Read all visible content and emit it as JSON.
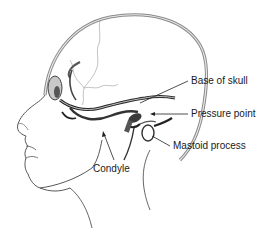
{
  "diagram": {
    "labels": [
      {
        "id": "base-of-skull",
        "text": "Base of skull"
      },
      {
        "id": "pressure-point",
        "text": "Pressure point"
      },
      {
        "id": "mastoid-process",
        "text": "Mastoid process"
      },
      {
        "id": "condyle",
        "text": "Condyle"
      }
    ]
  },
  "colors": {
    "background": "#ffffff",
    "outline": "#333333",
    "skull_gray": "#9a9a9a",
    "bone_dark": "#2a2a2a",
    "label_text": "#1a1a1a"
  }
}
